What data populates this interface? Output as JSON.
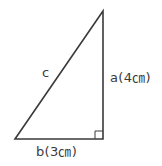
{
  "figure": {
    "type": "right triangle",
    "line_color": "#3a3a3a",
    "vertices": {
      "top": {
        "x": 103,
        "y": 11
      },
      "bottom_left": {
        "x": 15,
        "y": 139
      },
      "right_angle": {
        "x": 103,
        "y": 139
      }
    },
    "right_angle_marker_size": 8
  },
  "labels": {
    "hypotenuse": "c",
    "vertical_side": "a(4㎝)",
    "horizontal_side": "b(3㎝)"
  }
}
